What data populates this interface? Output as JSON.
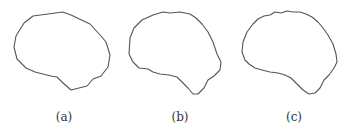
{
  "figure": {
    "panels": [
      {
        "id": "a",
        "caption": "(a)",
        "description": "coarse polygonal brain outline",
        "caption_x": 44
      },
      {
        "id": "b",
        "caption": "(b)",
        "description": "medium-detail brain outline",
        "caption_x": 160
      },
      {
        "id": "c",
        "caption": "(c)",
        "description": "fine-detail smooth brain outline",
        "caption_x": 274
      }
    ],
    "stroke_color": "#555555",
    "background_color": "#ffffff"
  }
}
